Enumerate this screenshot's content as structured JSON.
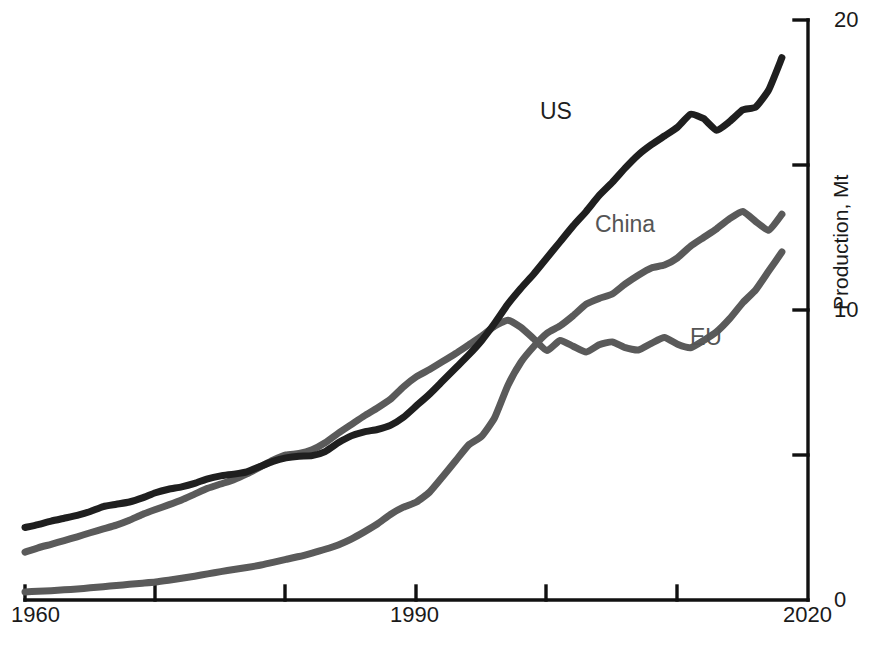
{
  "chart_data": {
    "type": "line",
    "title": "",
    "subtitle": "",
    "xlabel": "",
    "ylabel": "Production, Mt",
    "xlim": [
      1960,
      2020
    ],
    "ylim": [
      0,
      20
    ],
    "grid": false,
    "legend_position": "inline-annotations",
    "x_ticks": [
      1960,
      1970,
      1980,
      1990,
      2000,
      2010,
      2020
    ],
    "x_tick_labels": [
      "1960",
      "",
      "",
      "1990",
      "",
      "",
      "2020"
    ],
    "y_ticks": [
      0,
      5,
      10,
      15,
      20
    ],
    "y_tick_labels": [
      "0",
      "",
      "10",
      "",
      "20"
    ],
    "y_axis_side": "right",
    "annotations": [
      {
        "text": "US",
        "series": "US",
        "x": 1996,
        "y": 17.3
      },
      {
        "text": "China",
        "series": "China",
        "x": 2000,
        "y": 13.0
      },
      {
        "text": "EU",
        "series": "EU",
        "x": 2010,
        "y": 9.2
      }
    ],
    "x": [
      1960,
      1961,
      1962,
      1963,
      1964,
      1965,
      1966,
      1967,
      1968,
      1969,
      1970,
      1971,
      1972,
      1973,
      1974,
      1975,
      1976,
      1977,
      1978,
      1979,
      1980,
      1981,
      1982,
      1983,
      1984,
      1985,
      1986,
      1987,
      1988,
      1989,
      1990,
      1991,
      1992,
      1993,
      1994,
      1995,
      1996,
      1997,
      1998,
      1999,
      2000,
      2001,
      2002,
      2003,
      2004,
      2005,
      2006,
      2007,
      2008,
      2009,
      2010,
      2011,
      2012,
      2013,
      2014,
      2015,
      2016,
      2017,
      2018
    ],
    "series": [
      {
        "name": "US",
        "color": "#1f1f1f",
        "values": [
          2.5,
          2.6,
          2.72,
          2.82,
          2.92,
          3.05,
          3.22,
          3.3,
          3.38,
          3.52,
          3.7,
          3.82,
          3.9,
          4.02,
          4.18,
          4.28,
          4.34,
          4.42,
          4.6,
          4.78,
          4.9,
          4.96,
          4.98,
          5.12,
          5.42,
          5.66,
          5.8,
          5.88,
          6.02,
          6.3,
          6.7,
          7.1,
          7.55,
          8.0,
          8.45,
          8.95,
          9.55,
          10.2,
          10.75,
          11.25,
          11.8,
          12.35,
          12.9,
          13.4,
          13.95,
          14.4,
          14.9,
          15.35,
          15.7,
          16.0,
          16.3,
          16.75,
          16.6,
          16.2,
          16.5,
          16.9,
          17.0,
          17.6,
          18.7
        ]
      },
      {
        "name": "China",
        "color": "#5a5a5a",
        "values": [
          0.28,
          0.3,
          0.32,
          0.35,
          0.38,
          0.42,
          0.46,
          0.5,
          0.54,
          0.58,
          0.62,
          0.68,
          0.75,
          0.82,
          0.9,
          0.98,
          1.05,
          1.12,
          1.2,
          1.3,
          1.4,
          1.5,
          1.62,
          1.75,
          1.9,
          2.1,
          2.35,
          2.62,
          2.95,
          3.2,
          3.38,
          3.72,
          4.25,
          4.8,
          5.35,
          5.65,
          6.3,
          7.4,
          8.2,
          8.75,
          9.2,
          9.45,
          9.8,
          10.2,
          10.4,
          10.55,
          10.9,
          11.2,
          11.45,
          11.55,
          11.8,
          12.2,
          12.5,
          12.8,
          13.15,
          13.4,
          13.05,
          12.75,
          13.3
        ]
      },
      {
        "name": "EU",
        "color": "#5a5a5a",
        "values": [
          1.65,
          1.8,
          1.92,
          2.05,
          2.18,
          2.32,
          2.45,
          2.58,
          2.75,
          2.95,
          3.12,
          3.28,
          3.45,
          3.65,
          3.85,
          4.0,
          4.15,
          4.35,
          4.58,
          4.82,
          5.0,
          5.05,
          5.18,
          5.42,
          5.75,
          6.05,
          6.35,
          6.62,
          6.92,
          7.35,
          7.7,
          7.95,
          8.22,
          8.5,
          8.8,
          9.1,
          9.45,
          9.65,
          9.4,
          9.0,
          8.6,
          8.95,
          8.75,
          8.55,
          8.8,
          8.9,
          8.7,
          8.62,
          8.85,
          9.05,
          8.82,
          8.7,
          8.95,
          9.25,
          9.7,
          10.25,
          10.7,
          11.35,
          12.0
        ]
      }
    ]
  },
  "axis": {
    "y_title": "Production, Mt",
    "x_labels": {
      "start": "1960",
      "mid": "1990",
      "end": "2020"
    },
    "y_labels": {
      "zero": "0",
      "ten": "10",
      "twenty": "20"
    }
  },
  "labels": {
    "us": "US",
    "china": "China",
    "eu": "EU"
  },
  "caption": {
    "text": ""
  },
  "colors": {
    "us_line": "#1f1f1f",
    "china_line": "#5a5a5a",
    "eu_line": "#5a5a5a",
    "axis": "#111111",
    "background": "#ffffff"
  }
}
